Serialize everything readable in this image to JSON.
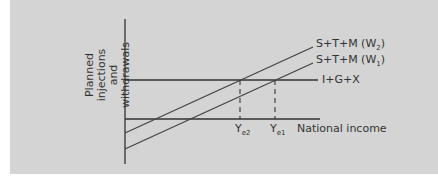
{
  "diagram": {
    "y_axis_label_line1": "Planned injections",
    "y_axis_label_line2": "and withdrawals",
    "x_axis_label": "National income",
    "injections_label": "I+G+X",
    "withdrawals_2_label": "S+T+M (W",
    "withdrawals_2_sub": "2",
    "withdrawals_1_label": "S+T+M (W",
    "withdrawals_1_sub": "1",
    "close_paren": ")",
    "ye2_label": "Y",
    "ye2_sub": "e2",
    "ye1_label": "Y",
    "ye1_sub": "e1",
    "colors": {
      "background": "#d4d4d4",
      "lines": "#333333"
    }
  }
}
